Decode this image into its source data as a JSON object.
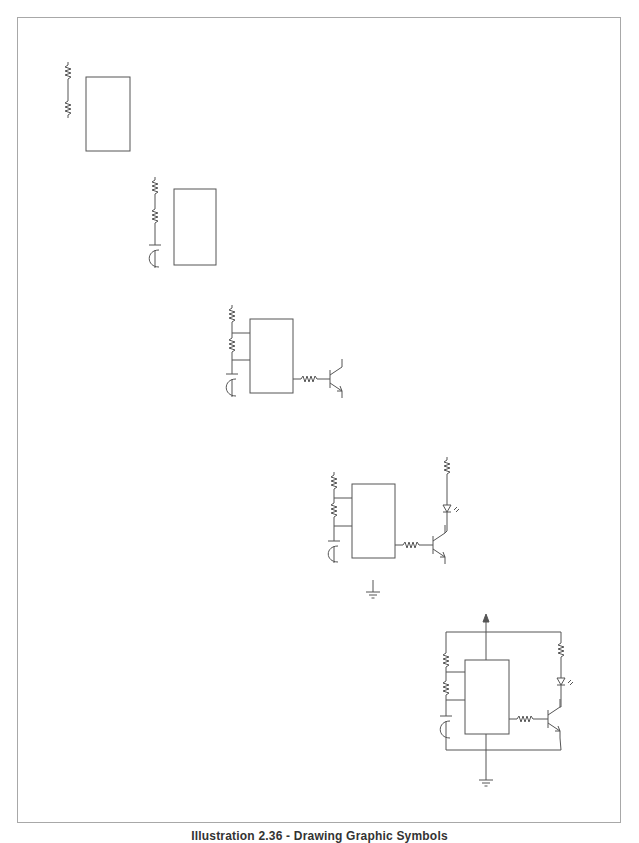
{
  "caption": "Illustration 2.36 - Drawing Graphic Symbols",
  "colors": {
    "stroke": "#555555",
    "frame": "#a8a8a8",
    "background": "#ffffff"
  },
  "figure": {
    "steps": [
      {
        "step": 1,
        "components": [
          "resistor",
          "resistor",
          "ic-box"
        ]
      },
      {
        "step": 2,
        "components": [
          "resistor",
          "resistor",
          "capacitor",
          "ic-box"
        ]
      },
      {
        "step": 3,
        "components": [
          "resistor",
          "resistor",
          "capacitor",
          "ic-box",
          "base-resistor",
          "npn-transistor"
        ]
      },
      {
        "step": 4,
        "components": [
          "resistor",
          "resistor",
          "capacitor",
          "ic-box",
          "base-resistor",
          "npn-transistor",
          "collector-resistor",
          "led",
          "ground"
        ]
      },
      {
        "step": 5,
        "components": [
          "resistor",
          "resistor",
          "capacitor",
          "ic-box",
          "base-resistor",
          "npn-transistor",
          "collector-resistor",
          "led",
          "ground",
          "output-arrow",
          "wiring"
        ]
      }
    ]
  }
}
